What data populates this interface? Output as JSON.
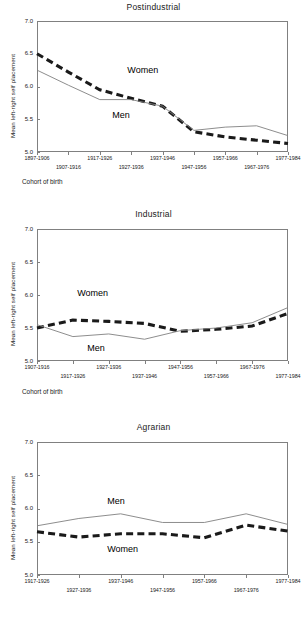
{
  "figure": {
    "ylabel": "Mean left-right self placement",
    "xlabel": "Cohort of birth",
    "series_names": {
      "women": "Women",
      "men": "Men"
    },
    "y_ticks": [
      "7.0",
      "6.5",
      "6.0",
      "5.5",
      "5.0"
    ]
  },
  "chart_data": [
    {
      "type": "line",
      "title": "Postindustrial",
      "xlabel": "Cohort of birth",
      "ylabel": "Mean left-right self placement",
      "ylim": [
        5.0,
        7.0
      ],
      "yticks": [
        5.0,
        5.5,
        6.0,
        6.5,
        7.0
      ],
      "grid": false,
      "legend": "inline-annotation",
      "categories": [
        "1897-1906",
        "1907-1916",
        "1917-1926",
        "1927-1936",
        "1937-1946",
        "1947-1956",
        "1957-1966",
        "1967-1976",
        "1977-1984"
      ],
      "series": [
        {
          "name": "Women",
          "style": "thick-dashed",
          "values": [
            6.5,
            6.22,
            5.95,
            5.82,
            5.7,
            5.31,
            5.23,
            5.18,
            5.13
          ]
        },
        {
          "name": "Men",
          "style": "thin-solid",
          "values": [
            6.25,
            6.02,
            5.8,
            5.8,
            5.7,
            5.33,
            5.38,
            5.4,
            5.25
          ]
        }
      ]
    },
    {
      "type": "line",
      "title": "Industrial",
      "xlabel": "Cohort of birth",
      "ylabel": "Mean left-right self placement",
      "ylim": [
        5.0,
        7.0
      ],
      "yticks": [
        5.0,
        5.5,
        6.0,
        6.5,
        7.0
      ],
      "grid": false,
      "legend": "inline-annotation",
      "categories": [
        "1907-1916",
        "1917-1926",
        "1927-1936",
        "1937-1946",
        "1947-1956",
        "1957-1966",
        "1967-1976",
        "1977-1984"
      ],
      "series": [
        {
          "name": "Women",
          "style": "thick-dashed",
          "values": [
            5.5,
            5.62,
            5.6,
            5.57,
            5.45,
            5.48,
            5.53,
            5.72
          ]
        },
        {
          "name": "Men",
          "style": "thin-solid",
          "values": [
            5.55,
            5.37,
            5.41,
            5.33,
            5.46,
            5.5,
            5.58,
            5.81
          ]
        }
      ]
    },
    {
      "type": "line",
      "title": "Agrarian",
      "xlabel": "",
      "ylabel": "Mean left-right self placement",
      "ylim": [
        5.0,
        7.0
      ],
      "yticks": [
        5.0,
        5.5,
        6.0,
        6.5,
        7.0
      ],
      "grid": false,
      "legend": "inline-annotation",
      "categories": [
        "1917-1926",
        "1927-1936",
        "1937-1946",
        "1947-1956",
        "1957-1966",
        "1967-1976",
        "1977-1984"
      ],
      "series": [
        {
          "name": "Women",
          "style": "thick-dashed",
          "values": [
            5.65,
            5.57,
            5.62,
            5.62,
            5.56,
            5.75,
            5.66
          ]
        },
        {
          "name": "Men",
          "style": "thin-solid",
          "values": [
            5.74,
            5.85,
            5.92,
            5.79,
            5.79,
            5.92,
            5.76
          ]
        }
      ]
    }
  ],
  "annotations": [
    {
      "chart": 0,
      "text": "Women",
      "x_pct": 36,
      "y_val": 6.23
    },
    {
      "chart": 0,
      "text": "Men",
      "x_pct": 30,
      "y_val": 5.55
    },
    {
      "chart": 1,
      "text": "Women",
      "x_pct": 16,
      "y_val": 6.02
    },
    {
      "chart": 1,
      "text": "Men",
      "x_pct": 20,
      "y_val": 5.18
    },
    {
      "chart": 2,
      "text": "Men",
      "x_pct": 28,
      "y_val": 6.1
    },
    {
      "chart": 2,
      "text": "Women",
      "x_pct": 28,
      "y_val": 5.38
    }
  ]
}
